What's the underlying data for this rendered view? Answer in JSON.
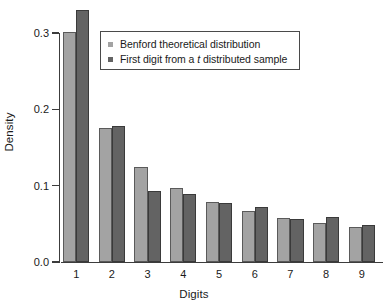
{
  "chart_data": {
    "type": "bar",
    "title": "",
    "xlabel": "Digits",
    "ylabel": "Density",
    "categories": [
      "1",
      "2",
      "3",
      "4",
      "5",
      "6",
      "7",
      "8",
      "9"
    ],
    "series": [
      {
        "name": "Benford theoretical distribution",
        "color": "#a3a3a3",
        "values": [
          0.301,
          0.176,
          0.125,
          0.097,
          0.079,
          0.067,
          0.058,
          0.051,
          0.046
        ]
      },
      {
        "name": "First digit from a t distributed sample",
        "color": "#636363",
        "values": [
          0.33,
          0.178,
          0.093,
          0.089,
          0.077,
          0.072,
          0.056,
          0.059,
          0.048
        ]
      }
    ],
    "yticks": [
      0.0,
      0.1,
      0.2,
      0.3
    ],
    "ytick_labels": [
      "0.0",
      "0.1",
      "0.2",
      "0.3"
    ],
    "ylim": [
      0.0,
      0.345
    ],
    "grid": false,
    "legend_position": "top-left-inside",
    "legend_entries": [
      {
        "label_prefix": "Benford theoretical distribution",
        "label_italic": "",
        "label_suffix": "",
        "color": "#a3a3a3"
      },
      {
        "label_prefix": "First digit from a ",
        "label_italic": "t",
        "label_suffix": " distributed sample",
        "color": "#636363"
      }
    ]
  },
  "axis": {
    "ylabel": "Density",
    "xlabel": "Digits"
  },
  "colors": {
    "light_bar": "#a3a3a3",
    "dark_bar": "#636363",
    "axis": "#3c3c3c",
    "background": "#ffffff"
  }
}
